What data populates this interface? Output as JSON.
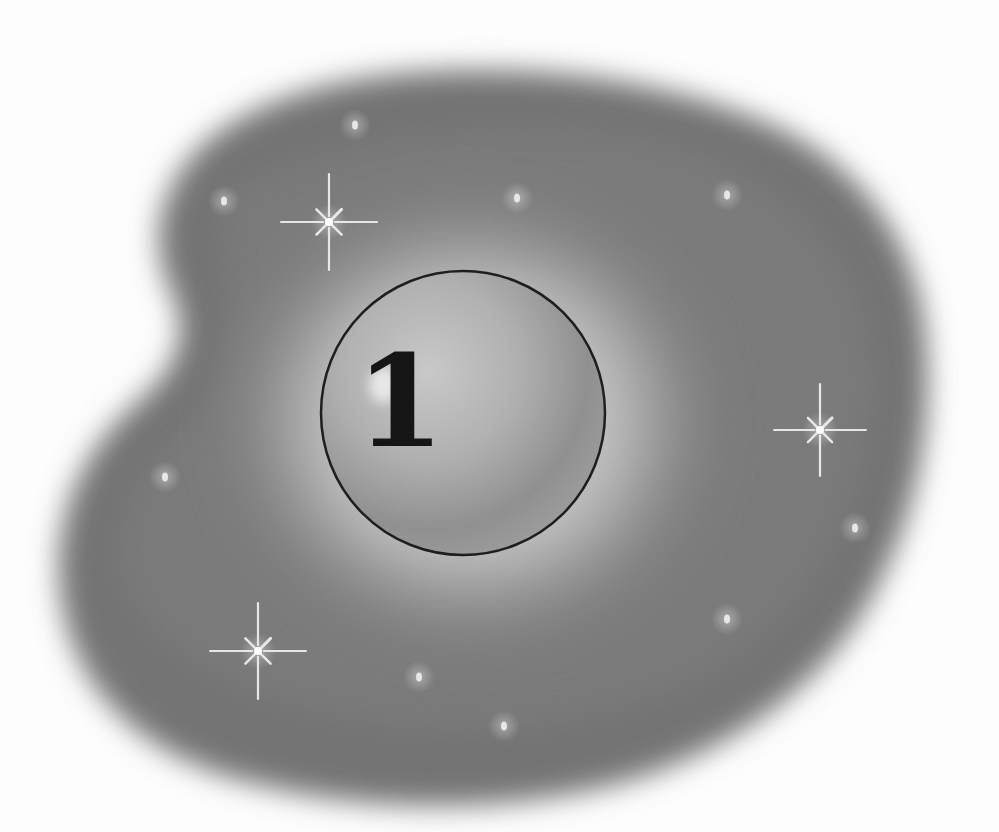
{
  "illustration": {
    "numeral": "1",
    "colors": {
      "background": "#ffffff",
      "cloud_dark": "#6e6e6e",
      "cloud_mid": "#8a8a8a",
      "halo": "#c4c4c4",
      "sphere": "#a6a6a6",
      "sphere_outline": "#1a1a1a",
      "numeral": "#111111",
      "sparkle": "#e8e8e8"
    },
    "sphere": {
      "cx": 463,
      "cy": 413,
      "r": 142
    },
    "sparkles": [
      {
        "name": "sparkle-top-left",
        "x": 329,
        "y": 222,
        "size": 48
      },
      {
        "name": "sparkle-right",
        "x": 820,
        "y": 430,
        "size": 46
      },
      {
        "name": "sparkle-bottom-left",
        "x": 258,
        "y": 651,
        "size": 48
      }
    ],
    "dots": [
      {
        "x": 355,
        "y": 125
      },
      {
        "x": 224,
        "y": 201
      },
      {
        "x": 517,
        "y": 198
      },
      {
        "x": 727,
        "y": 195
      },
      {
        "x": 165,
        "y": 477
      },
      {
        "x": 855,
        "y": 528
      },
      {
        "x": 727,
        "y": 619
      },
      {
        "x": 419,
        "y": 677
      },
      {
        "x": 504,
        "y": 726
      }
    ]
  }
}
